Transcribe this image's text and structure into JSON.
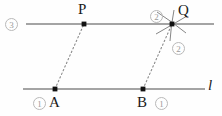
{
  "figure": {
    "canvas": {
      "width": 222,
      "height": 116,
      "background": "#fefefe"
    },
    "colors": {
      "line": "#4a4a4a",
      "dashed": "#8a8a8a",
      "point": "#111111",
      "label": "#1a1a1a",
      "badge": "#9a9a9a",
      "badge_border": "#b9b9b9",
      "arc": "#777777"
    },
    "lines": [
      {
        "name": "top-line",
        "x1": 26,
        "y1": 24,
        "x2": 214,
        "y2": 24
      },
      {
        "name": "bottom-line",
        "x1": 23,
        "y1": 89,
        "x2": 205,
        "y2": 89
      }
    ],
    "dashed_segments": [
      {
        "name": "segment-AP",
        "x1": 55,
        "y1": 89,
        "x2": 84,
        "y2": 24
      },
      {
        "name": "segment-BQ",
        "x1": 143,
        "y1": 89,
        "x2": 172,
        "y2": 24
      }
    ],
    "points": [
      {
        "name": "point-P",
        "label": "P",
        "x": 84,
        "y": 24,
        "label_x": 78,
        "label_y": 2
      },
      {
        "name": "point-Q",
        "label": "Q",
        "x": 172,
        "y": 24,
        "label_x": 178,
        "label_y": 3
      },
      {
        "name": "point-A",
        "label": "A",
        "x": 55,
        "y": 89,
        "label_x": 49,
        "label_y": 95
      },
      {
        "name": "point-B",
        "label": "B",
        "x": 143,
        "y": 89,
        "label_x": 137,
        "label_y": 95
      }
    ],
    "line_labels": [
      {
        "name": "line-label-l",
        "text": "l",
        "x": 208,
        "y": 78
      }
    ],
    "step_badges": [
      {
        "name": "step-badge-3-left",
        "text": "3",
        "x": 5,
        "y": 18
      },
      {
        "name": "step-badge-2-upper",
        "text": "2",
        "x": 150,
        "y": 10
      },
      {
        "name": "step-badge-2-lower",
        "text": "2",
        "x": 172,
        "y": 42
      },
      {
        "name": "step-badge-1-at-a",
        "text": "1",
        "x": 33,
        "y": 97
      },
      {
        "name": "step-badge-1-at-b",
        "text": "1",
        "x": 155,
        "y": 97
      }
    ],
    "arc_strokes": [
      {
        "name": "arc-stroke-upper-left",
        "x1": 158,
        "y1": 13,
        "x2": 185,
        "y2": 33
      },
      {
        "name": "arc-stroke-lower-left",
        "x1": 157,
        "y1": 33,
        "x2": 186,
        "y2": 16
      },
      {
        "name": "arc-stroke-vertical",
        "x1": 173,
        "y1": 11,
        "x2": 171,
        "y2": 40
      }
    ]
  }
}
